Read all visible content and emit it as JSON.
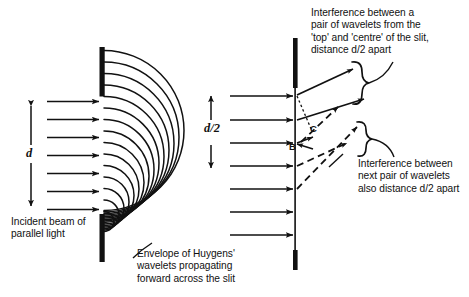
{
  "figure": {
    "background_color": "#ffffff",
    "ink_color": "#111111"
  },
  "left_diagram": {
    "name": "huygens-wavelets-slit",
    "dimension_label": "d",
    "incident_caption": "Incident beam of\nparallel light",
    "envelope_caption": "Envelope of Huygens'\nwavelets propagating\nforward across the slit",
    "incident_ray_count": 7,
    "wavelet_count": 11,
    "barrier": {
      "x": 102,
      "top": 47,
      "bottom": 262,
      "slit_top": 96,
      "slit_bottom": 214
    }
  },
  "right_diagram": {
    "name": "path-difference-pairs",
    "dimension_label": "d/2",
    "point_labels": [
      "B",
      "C"
    ],
    "top_caption": "Interference between a\npair of wavelets from the\n'top' and 'centre' of the slit,\ndistance d/2 apart",
    "bottom_caption": "Interference between\nnext pair of wavelets\nalso distance d/2 apart",
    "incident_ray_count": 7,
    "diffracted_ray_count": 4,
    "brace_count": 2,
    "barrier": {
      "x": 295,
      "top": 38,
      "bottom": 270,
      "slit_top": 88,
      "slit_bottom": 250
    }
  },
  "colors": {
    "ink": "#111111",
    "paper": "#ffffff"
  }
}
